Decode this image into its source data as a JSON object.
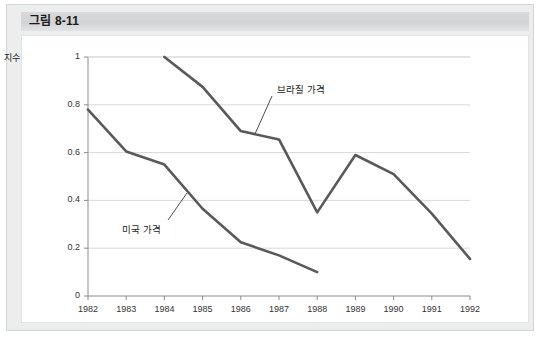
{
  "figure": {
    "title": "그림 8-11"
  },
  "chart_data": {
    "type": "line",
    "title": "",
    "xlabel": "",
    "ylabel": "지수",
    "x": [
      1982,
      1983,
      1984,
      1985,
      1986,
      1987,
      1988,
      1989,
      1990,
      1991,
      1992
    ],
    "xtick_labels": [
      "1982",
      "1983",
      "1984",
      "1985",
      "1986",
      "1987",
      "1988",
      "1989",
      "1990",
      "1991",
      "1992"
    ],
    "ytick_labels": [
      "0",
      "0.2",
      "0.4",
      "0.6",
      "0.8",
      "1"
    ],
    "yticks": [
      0,
      0.2,
      0.4,
      0.6,
      0.8,
      1
    ],
    "ylim": [
      0,
      1
    ],
    "xlim": [
      1982,
      1992
    ],
    "grid": "horizontal",
    "legend": "annotations-inline",
    "line_color": "#595959",
    "grid_color": "#d9d9d9",
    "axis_color": "#8c8c8c",
    "series": [
      {
        "name": "미국 가격",
        "x": [
          1982,
          1983,
          1984,
          1985,
          1986,
          1987,
          1988
        ],
        "values": [
          0.78,
          0.605,
          0.55,
          0.365,
          0.225,
          0.17,
          0.1
        ],
        "annotation": "미국 가격"
      },
      {
        "name": "브라질 가격",
        "x": [
          1984,
          1985,
          1986,
          1987,
          1988,
          1989,
          1990,
          1991,
          1992
        ],
        "values": [
          1.0,
          0.875,
          0.69,
          0.655,
          0.35,
          0.59,
          0.51,
          0.345,
          0.155
        ],
        "annotation": "브라질 가격"
      }
    ],
    "annotations": [
      {
        "text": "브라질 가격",
        "label_x": 277,
        "label_y": 82,
        "leader_from_x": 272,
        "leader_from_y": 96,
        "leader_to_x": 255,
        "leader_to_y": 134
      },
      {
        "text": "미국 가격",
        "label_x": 122,
        "label_y": 222,
        "leader_from_x": 168,
        "leader_from_y": 220,
        "leader_to_x": 187,
        "leader_to_y": 193
      }
    ]
  }
}
